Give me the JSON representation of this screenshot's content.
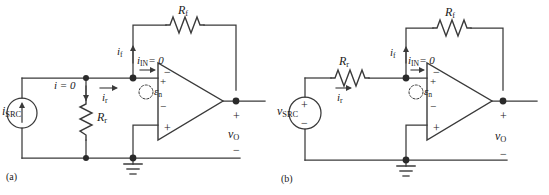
{
  "figure": {
    "type": "circuit-schematic-pair",
    "background": "#ffffff",
    "line_color": "#3a3a3a",
    "text_color": "#1a1a1a"
  },
  "panel_a": {
    "caption": "(a)",
    "source": {
      "kind": "current-source",
      "label_main": "i",
      "label_sub": "SRC",
      "arrow_direction": "up"
    },
    "shunt_resistor": {
      "label_main": "R",
      "label_sub": "r",
      "orientation": "vertical"
    },
    "feedback_resistor": {
      "label_main": "R",
      "label_sub": "f",
      "orientation": "horizontal"
    },
    "currents": {
      "i_zero": {
        "text": "i = 0",
        "arrow_direction": "down"
      },
      "i_r": {
        "label_main": "i",
        "label_sub": "r",
        "arrow_direction": "right"
      },
      "i_f": {
        "label_main": "i",
        "label_sub": "f",
        "arrow_direction": "up"
      },
      "i_in": {
        "text": "= 0",
        "label_main": "i",
        "label_sub": "IN",
        "arrow_direction": "right"
      }
    },
    "offset_source": {
      "label_main": "ε",
      "label_sub": "n",
      "plus": "+",
      "minus": "−",
      "style": "dashed-circle"
    },
    "opamp": {
      "inverting_symbol": "−",
      "noninverting_symbol": "+"
    },
    "output": {
      "label_main": "v",
      "label_sub": "O",
      "plus": "+",
      "minus": "−"
    },
    "ground": {
      "symbol": "earth-ground"
    }
  },
  "panel_b": {
    "caption": "(b)",
    "source": {
      "kind": "voltage-source",
      "label_main": "v",
      "label_sub": "SRC",
      "plus": "+",
      "minus": "−"
    },
    "series_resistor": {
      "label_main": "R",
      "label_sub": "r",
      "orientation": "horizontal"
    },
    "feedback_resistor": {
      "label_main": "R",
      "label_sub": "f",
      "orientation": "horizontal"
    },
    "currents": {
      "i_r": {
        "label_main": "i",
        "label_sub": "r",
        "arrow_direction": "right"
      },
      "i_f": {
        "label_main": "i",
        "label_sub": "f",
        "arrow_direction": "up"
      },
      "i_in": {
        "text": "= 0",
        "label_main": "i",
        "label_sub": "IN",
        "arrow_direction": "right"
      }
    },
    "offset_source": {
      "label_main": "ε",
      "label_sub": "n",
      "plus": "+",
      "minus": "−",
      "style": "dashed-circle"
    },
    "opamp": {
      "inverting_symbol": "−",
      "noninverting_symbol": "+"
    },
    "output": {
      "label_main": "v",
      "label_sub": "O",
      "plus": "+",
      "minus": "−"
    },
    "ground": {
      "symbol": "earth-ground"
    }
  }
}
